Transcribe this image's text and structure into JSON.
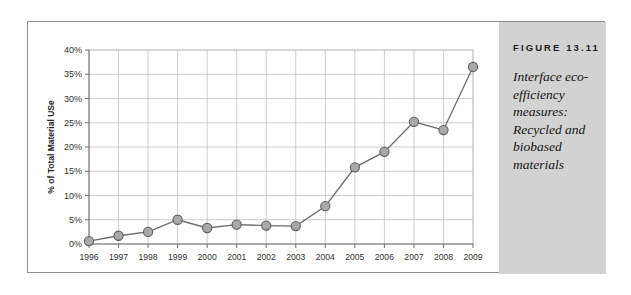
{
  "figure": {
    "caption_title": "FIGURE 13.11",
    "caption_body": "Interface eco-efficiency measures: Recycled and biobased materials",
    "panel_color": "#d2d2d2",
    "frame_color": "#8e8e8e"
  },
  "chart_data": {
    "type": "line",
    "title": "",
    "xlabel": "",
    "ylabel": "% of Total Material USe",
    "categories": [
      "1996",
      "1997",
      "1998",
      "1999",
      "2000",
      "2001",
      "2002",
      "2003",
      "2004",
      "2005",
      "2006",
      "2007",
      "2008",
      "2009"
    ],
    "values": [
      0.6,
      1.7,
      2.5,
      5.0,
      3.3,
      4.0,
      3.8,
      3.7,
      7.8,
      15.8,
      19.0,
      25.2,
      23.5,
      36.5
    ],
    "ytick_labels": [
      "0%",
      "5%",
      "10%",
      "15%",
      "20%",
      "25%",
      "30%",
      "35%",
      "40%"
    ],
    "yticks": [
      0,
      5,
      10,
      15,
      20,
      25,
      30,
      35,
      40
    ],
    "ylim": [
      0,
      40
    ],
    "grid": true,
    "legend": "none",
    "marker": "circle",
    "line_color": "#6b6b6b",
    "marker_fill": "#a9a9a9",
    "marker_stroke": "#5d5d5d",
    "gridline_color": "#c0c0c0"
  }
}
